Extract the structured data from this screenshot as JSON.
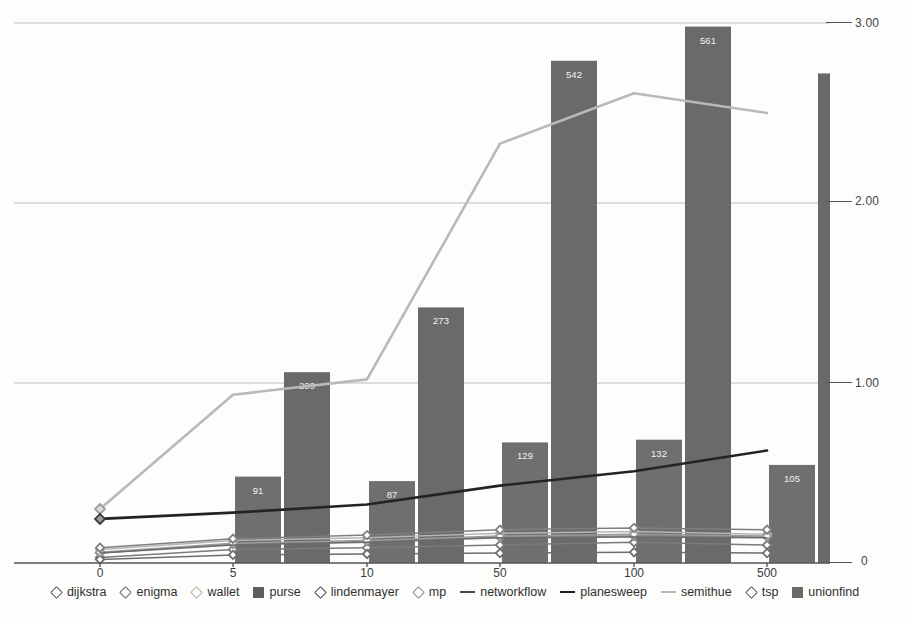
{
  "chart_data": {
    "type": "bar",
    "title": "",
    "subtitle": "",
    "xlabel": "",
    "ylabel": "",
    "y_right_ticks": [
      "0",
      "1.00",
      "2.00",
      "3.00"
    ],
    "y_right_values": [
      0,
      1.0,
      2.0,
      3.0
    ],
    "ylim": [
      0,
      3.2
    ],
    "grid": true,
    "legend_position": "bottom",
    "categories": [
      "0",
      "5",
      "10",
      "50",
      "100",
      "500"
    ],
    "bar_series": [
      {
        "name": "purse",
        "kind": "bar",
        "color": "#6f6f6f",
        "labels": [
          "",
          "91",
          "87",
          "129",
          "132",
          "105"
        ],
        "values": [
          0,
          91,
          87,
          129,
          132,
          105
        ],
        "scaled": [
          0,
          0.48,
          0.455,
          0.67,
          0.685,
          0.545
        ]
      },
      {
        "name": "unionfind",
        "kind": "bar",
        "color": "#6a6a6a",
        "labels": [
          "",
          "209",
          "273",
          "542",
          "561",
          "525"
        ],
        "values": [
          0,
          209,
          273,
          542,
          561,
          525
        ],
        "scaled": [
          0,
          1.06,
          1.42,
          2.79,
          2.98,
          2.72
        ]
      }
    ],
    "line_series": [
      {
        "name": "dijkstra",
        "kind": "line-marker",
        "marker": "diamond",
        "color": "#7a7a7a",
        "values": [
          0.03,
          0.075,
          0.085,
          0.1,
          0.115,
          0.1
        ]
      },
      {
        "name": "enigma",
        "kind": "line-marker",
        "marker": "diamond",
        "color": "#8a8a8a",
        "values": [
          0.055,
          0.105,
          0.12,
          0.145,
          0.15,
          0.145
        ]
      },
      {
        "name": "wallet",
        "kind": "line-marker",
        "marker": "diamond",
        "color": "#b5b5b5",
        "values": [
          0.075,
          0.125,
          0.14,
          0.165,
          0.175,
          0.16
        ]
      },
      {
        "name": "lindenmayer",
        "kind": "line-marker",
        "marker": "diamond",
        "color": "#6d6d6d",
        "values": [
          0.02,
          0.045,
          0.05,
          0.055,
          0.06,
          0.055
        ]
      },
      {
        "name": "mp",
        "kind": "line-marker",
        "marker": "diamond",
        "color": "#9a9a9a",
        "values": [
          0.06,
          0.11,
          0.125,
          0.15,
          0.16,
          0.15
        ]
      },
      {
        "name": "networkflow",
        "kind": "line",
        "color": "#6b6b6b",
        "values": [
          0.055,
          0.1,
          0.115,
          0.14,
          0.145,
          0.14
        ]
      },
      {
        "name": "planesweep",
        "kind": "line",
        "color": "#232323",
        "values": [
          0.245,
          0.28,
          0.325,
          0.43,
          0.51,
          0.625
        ]
      },
      {
        "name": "semithue",
        "kind": "line",
        "color": "#b9b9b9",
        "values": [
          0.3,
          0.935,
          1.02,
          2.33,
          2.61,
          2.5
        ]
      },
      {
        "name": "tsp",
        "kind": "line-marker",
        "marker": "diamond",
        "color": "#7f7f7f",
        "values": [
          0.085,
          0.135,
          0.155,
          0.185,
          0.195,
          0.185
        ]
      }
    ]
  },
  "legend": {
    "items": [
      {
        "label": "dijkstra",
        "icon": "diamond-marker-icon",
        "kind": "marker",
        "color": "#5c5c5c"
      },
      {
        "label": "enigma",
        "icon": "diamond-marker-icon",
        "kind": "marker",
        "color": "#6b6b6b"
      },
      {
        "label": "wallet",
        "icon": "diamond-marker-icon",
        "kind": "marker",
        "color": "#b0b0b0"
      },
      {
        "label": "purse",
        "icon": "square-swatch-icon",
        "kind": "swatch",
        "color": "#5d5d5d"
      },
      {
        "label": "lindenmayer",
        "icon": "diamond-marker-icon",
        "kind": "marker",
        "color": "#4f4f4f"
      },
      {
        "label": "mp",
        "icon": "diamond-marker-icon",
        "kind": "marker",
        "color": "#8f8f8f"
      },
      {
        "label": "networkflow",
        "icon": "line-segment-icon",
        "kind": "line",
        "color": "#4a4a4a"
      },
      {
        "label": "planesweep",
        "icon": "line-segment-icon",
        "kind": "line",
        "color": "#1f1f1f"
      },
      {
        "label": "semithue",
        "icon": "line-segment-icon",
        "kind": "line",
        "color": "#b9b9b9"
      },
      {
        "label": "tsp",
        "icon": "diamond-marker-icon",
        "kind": "marker",
        "color": "#5c5c5c"
      },
      {
        "label": "unionfind",
        "icon": "square-swatch-icon",
        "kind": "swatch",
        "color": "#6a6a6a"
      }
    ]
  },
  "axes": {
    "x_tick_labels": [
      "0",
      "5",
      "10",
      "50",
      "100",
      "500"
    ],
    "y_tick_labels": [
      "3.00",
      "2.00",
      "1.00",
      "0"
    ]
  },
  "colors": {
    "grid": "#bdbdbd",
    "axis": "#555555",
    "bar_purse": "#6f6f6f",
    "bar_unionfind": "#6a6a6a",
    "semithue": "#b9b9b9",
    "planesweep": "#232323",
    "label_text": "#f2f2f2",
    "background": "#ffffff"
  }
}
